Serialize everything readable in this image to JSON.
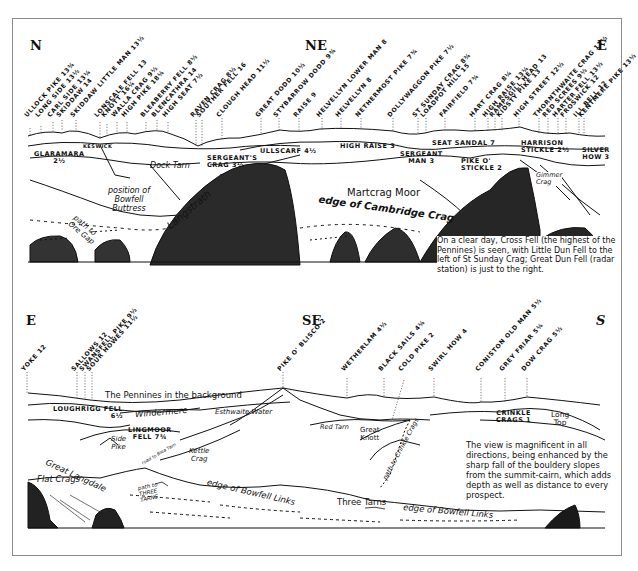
{
  "panel_top": {
    "directions": {
      "left": "N",
      "mid": "NE",
      "right": "E"
    },
    "summits": [
      {
        "label": "ULLOCK PIKE 13¾",
        "x": 30
      },
      {
        "label": "LONG SIDE 13½",
        "x": 41
      },
      {
        "label": "CARL SIDE 13¼",
        "x": 53
      },
      {
        "label": "SKIDDAW 14",
        "x": 62
      },
      {
        "label": "SKIDDAW LITTLE MAN 13½",
        "x": 76
      },
      {
        "label": "LONSCALE FELL 13",
        "x": 100
      },
      {
        "label": "KNOTT 16¼",
        "x": 107
      },
      {
        "label": "WALLA CRAG 9½",
        "x": 117
      },
      {
        "label": "HIGH PIKE 18¼",
        "x": 127
      },
      {
        "label": "BLEABERRY FELL 8½",
        "x": 146
      },
      {
        "label": "BLENCATHRA 14",
        "x": 157
      },
      {
        "label": "HIGH SEAT 7½",
        "x": 168
      },
      {
        "label": "RAVEN CRAG 8½",
        "x": 196
      },
      {
        "label": "SOUTHER FELL 16",
        "x": 202
      },
      {
        "label": "CLOUGH HEAD 11½",
        "x": 222
      },
      {
        "label": "GREAT DODD 10½",
        "x": 261
      },
      {
        "label": "STYBARROW DODD 9¾",
        "x": 279
      },
      {
        "label": "RAISE 9",
        "x": 299
      },
      {
        "label": "HELVELLYN LOWER MAN 8",
        "x": 322
      },
      {
        "label": "HELVELLYN 8",
        "x": 341
      },
      {
        "label": "NETHERMOST PIKE 7¾",
        "x": 361
      },
      {
        "label": "DOLLYWAGGON PIKE 7½",
        "x": 393
      },
      {
        "label": "ST SUNDAY CRAG 8¾",
        "x": 418
      },
      {
        "label": "LOADPOT HILL 15",
        "x": 426
      },
      {
        "label": "FAIRFIELD 7¾",
        "x": 445
      },
      {
        "label": "HART CRAG 8¼",
        "x": 475
      },
      {
        "label": "HIGH RAISE 13¼",
        "x": 488
      },
      {
        "label": "RAMPSGILL HEAD 13",
        "x": 495
      },
      {
        "label": "KIDSTY PIKE 13",
        "x": 502
      },
      {
        "label": "HIGH STREET 12½",
        "x": 519
      },
      {
        "label": "THORNTHWAITE CRAG 11½",
        "x": 539
      },
      {
        "label": "RED SCREES 9½",
        "x": 548
      },
      {
        "label": "HARTER FELL 13½",
        "x": 558
      },
      {
        "label": "FROSWICK 12",
        "x": 566
      },
      {
        "label": "ILL BELL 12",
        "x": 579
      },
      {
        "label": "KENTMERE PIKE 13½",
        "x": 584
      }
    ],
    "labels": {
      "keswick": "KESWICK",
      "glaramara": "GLARAMARA\n2½",
      "dock_tarn": "Dock Tarn",
      "sergeants_crag": "SERGEANT'S\nCRAG 3½",
      "ullscarf": "ULLSCARF 4½",
      "high_raise": "HIGH RAISE 3",
      "seat_sandal": "SEAT SANDAL 7",
      "sergeant_man": "SERGEANT\nMAN 3",
      "harrison_stickle": "HARRISON\nSTICKLE 2½",
      "pike_o_stickle": "PIKE O'\nSTICKLE 2",
      "silver_how": "SILVER\nHOW 3",
      "gimmer_crag": "Gimmer\nCrag",
      "bowfell_buttress": "position of\nBowfell\nButtress",
      "langstrath": "Langstrath",
      "path_ore_gap": "path to\nOre Gap",
      "martcrag_moor": "Martcrag Moor",
      "cambridge_crag": "edge of Cambridge Crag"
    },
    "note": "On a clear day, Cross Fell (the highest of the Pennines) is seen, with Little Dun Fell to the left of St Sunday Crag; Great Dun Fell (radar station) is just to the right."
  },
  "panel_bottom": {
    "directions": {
      "left": "E",
      "mid": "SE",
      "right": "S"
    },
    "summits": [
      {
        "label": "YOKE 12",
        "x": 27
      },
      {
        "label": "SALLOWS 12",
        "x": 77
      },
      {
        "label": "SWANSFELL PIKE 9½",
        "x": 85
      },
      {
        "label": "SOUR HOWES 11½",
        "x": 92
      },
      {
        "label": "PIKE O' BLISCO 2",
        "x": 283
      },
      {
        "label": "WETHERLAM 4½",
        "x": 347
      },
      {
        "label": "BLACK SAILS 4¼",
        "x": 384
      },
      {
        "label": "COLD PIKE 2",
        "x": 404
      },
      {
        "label": "SWIRL HOW 4",
        "x": 434
      },
      {
        "label": "CONISTON OLD MAN 5½",
        "x": 481
      },
      {
        "label": "GREY FRIAR 5¼",
        "x": 505
      },
      {
        "label": "DOW CRAG 5½",
        "x": 527
      }
    ],
    "labels": {
      "pennines": "The Pennines in the background",
      "loughrigg": "LOUGHRIGG FELL\n6½",
      "windermere": "Windermere",
      "esthwaite": "Esthwaite Water",
      "lingmoor": "LINGMOOR\nFELL 7¾",
      "side_pike": "Side\nPike",
      "road_blea_tarn": "road to Blea Tarn",
      "kettle_crag": "Kettle\nCrag",
      "great_langdale": "Great Langdale",
      "red_tarn": "Red Tarn",
      "great_knott": "Great\nKnott",
      "crinkle_crags": "CRINKLE\nCRAGS 1",
      "long_top": "Long\nTop",
      "path_crinkle": "path to Crinkle Crags",
      "flat_crags": "Flat Crags",
      "path_three_tarns": "path to\nTHREE\nTARNS",
      "bowfell_links_1": "edge of Bowfell Links",
      "three_tarns": "Three Tarns",
      "bowfell_links_2": "edge of Bowfell Links"
    },
    "note": "The view is magnificent in all directions, being enhanced by the sharp fall of the bouldery slopes from the summit-cairn, which adds depth as well as distance to every prospect."
  },
  "colors": {
    "ink": "#111111",
    "paper": "#ffffff",
    "frame": "#8a8a8a"
  }
}
